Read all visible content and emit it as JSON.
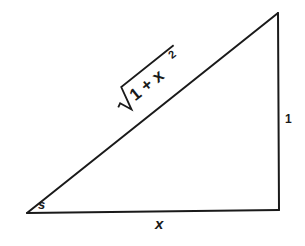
{
  "diagram": {
    "type": "right-triangle",
    "vertices": {
      "bottom_left": [
        27,
        213
      ],
      "bottom_right": [
        279,
        210
      ],
      "top_right": [
        278,
        13
      ]
    },
    "labels": {
      "angle": "s",
      "base": "x",
      "height": "1",
      "hypotenuse_radical": "√",
      "hypotenuse_radicand": "1 + x",
      "hypotenuse_exponent": "2"
    },
    "colors": {
      "stroke": "#1a1a1a",
      "background": "#ffffff"
    }
  }
}
